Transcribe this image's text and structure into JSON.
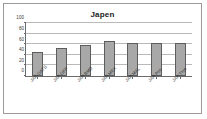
{
  "chart_data": {
    "type": "bar",
    "title": "Japen",
    "xlabel": "",
    "ylabel": "",
    "ylim": [
      0,
      100
    ],
    "yticks": [
      0,
      20,
      40,
      60,
      80,
      100
    ],
    "grid": true,
    "legend": false,
    "categories": [
      "JAP-OATS",
      "JAP-OFF",
      "JAP-BMD",
      "JAP-MEX",
      "JAP-MAL",
      "JAP-PHI",
      "JAP-THA"
    ],
    "values": [
      45,
      53,
      59,
      67,
      63,
      62,
      62
    ],
    "bar_color": "#a8a8a8",
    "bar_border_color": "#5d5d5d",
    "gridline_color": "#b9b9b9",
    "axis_color": "#6b6b6b",
    "frame_color": "#9a9a9a",
    "background": "#ffffff"
  }
}
